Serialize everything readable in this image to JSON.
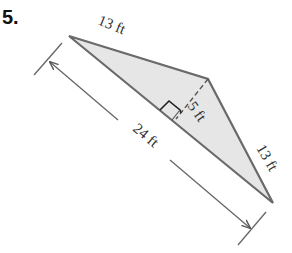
{
  "problem": {
    "number": "5."
  },
  "figure": {
    "type": "triangle",
    "fill_color": "#e6e6e6",
    "stroke_color": "#666666",
    "vertices": {
      "left": [
        69,
        36
      ],
      "top": [
        208,
        79
      ],
      "bottom_right": [
        273,
        203
      ]
    },
    "labels": {
      "left_side": "13 ft",
      "right_side": "13 ft",
      "height": "5 ft",
      "base": "24 ft"
    }
  }
}
